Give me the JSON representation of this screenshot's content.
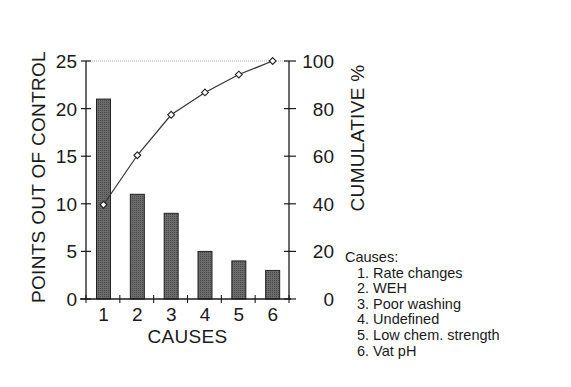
{
  "chart_data": {
    "type": "bar",
    "subtype": "pareto",
    "title": "",
    "xlabel": "CAUSES",
    "ylabel": "POINTS OUT OF CONTROL",
    "y2label": "CUMULATIVE %",
    "categories": [
      "1",
      "2",
      "3",
      "4",
      "5",
      "6"
    ],
    "series": [
      {
        "name": "Points out of control",
        "type": "bar",
        "axis": "left",
        "values": [
          21,
          11,
          9,
          5,
          4,
          3
        ]
      },
      {
        "name": "Cumulative %",
        "type": "line",
        "axis": "right",
        "marker": "open-diamond",
        "values": [
          39.6,
          60.4,
          77.4,
          86.8,
          94.3,
          100
        ]
      }
    ],
    "ylim": [
      0,
      25
    ],
    "y2lim": [
      0,
      100
    ],
    "yticks": [
      "0",
      "5",
      "10",
      "15",
      "20",
      "25"
    ],
    "y2ticks": [
      "0",
      "20",
      "40",
      "60",
      "80",
      "100"
    ],
    "grid": false,
    "top_reference_line": true,
    "legend": {
      "position": "lower-right",
      "title": "Causes:",
      "entries": [
        "1. Rate changes",
        "2. WEH",
        "3. Poor washing",
        "4. Undefined",
        "5. Low chem. strength",
        "6. Vat pH"
      ]
    },
    "colors": {
      "bar": "#5a5a5a",
      "line": "#333333",
      "axis": "#1a1a1a",
      "reference": "#b0b0b0"
    }
  }
}
